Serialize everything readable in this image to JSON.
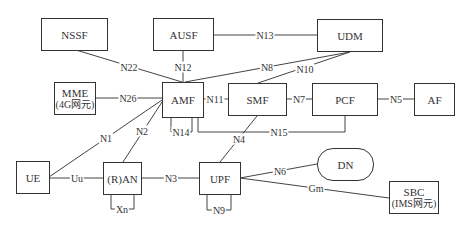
{
  "nodes": {
    "nssf": {
      "label": "NSSF"
    },
    "ausf": {
      "label": "AUSF"
    },
    "udm": {
      "label": "UDM"
    },
    "mme": {
      "label": "MME",
      "sublabel": "(4G网元)"
    },
    "amf": {
      "label": "AMF"
    },
    "smf": {
      "label": "SMF"
    },
    "pcf": {
      "label": "PCF"
    },
    "af": {
      "label": "AF"
    },
    "ue": {
      "label": "UE"
    },
    "ran": {
      "label": "(R)AN"
    },
    "upf": {
      "label": "UPF"
    },
    "dn": {
      "label": "DN"
    },
    "sbc": {
      "label": "SBC",
      "sublabel": "(IMS网元)"
    }
  },
  "interfaces": {
    "n22": "N22",
    "n12": "N12",
    "n13": "N13",
    "n8": "N8",
    "n10": "N10",
    "n26": "N26",
    "n11": "N11",
    "n7": "N7",
    "n5": "N5",
    "n14": "N14",
    "n15": "N15",
    "n1": "N1",
    "n2": "N2",
    "n4": "N4",
    "uu": "Uu",
    "n3": "N3",
    "n6": "N6",
    "gm": "Gm",
    "xn": "Xn",
    "n9": "N9"
  },
  "colors": {
    "line": "#444444",
    "border": "#333333",
    "text": "#333333"
  }
}
